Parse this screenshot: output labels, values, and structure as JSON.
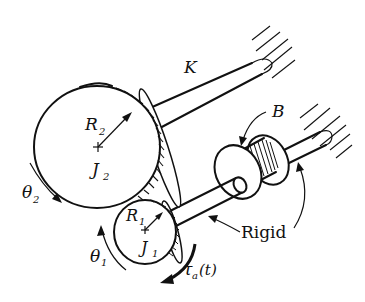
{
  "diagram": {
    "type": "mechanical gear train schematic",
    "labels": {
      "spring": "K",
      "damper": "B",
      "large_gear_radius": "R",
      "large_gear_radius_sub": "2",
      "large_gear_inertia": "J",
      "large_gear_inertia_sub": "2",
      "large_gear_angle": "θ",
      "large_gear_angle_sub": "2",
      "small_gear_radius": "R",
      "small_gear_radius_sub": "1",
      "small_gear_inertia": "J",
      "small_gear_inertia_sub": "1",
      "small_gear_angle": "θ",
      "small_gear_angle_sub": "1",
      "rigid_label": "Rigid",
      "torque": "τ",
      "torque_sub": "a",
      "torque_arg": "(t)"
    },
    "components": [
      {
        "name": "large-gear",
        "center": [
          98,
          147
        ],
        "radius": 63
      },
      {
        "name": "small-gear",
        "center": [
          145,
          232
        ],
        "radius": 32
      },
      {
        "name": "torsional-spring-shaft",
        "from": [
          155,
          120
        ],
        "to": [
          270,
          55
        ]
      },
      {
        "name": "damper",
        "center": [
          262,
          172
        ]
      },
      {
        "name": "fixed-wall-top"
      },
      {
        "name": "fixed-wall-right"
      }
    ],
    "colors": {
      "ink": "#111111",
      "background": "#ffffff"
    }
  }
}
